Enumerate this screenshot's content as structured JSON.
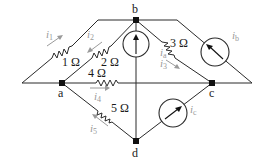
{
  "diagram": {
    "type": "circuit",
    "nodes": {
      "a": {
        "label": "a"
      },
      "b": {
        "label": "b"
      },
      "c": {
        "label": "c"
      },
      "d": {
        "label": "d"
      }
    },
    "resistors": {
      "r1": {
        "label": "1 Ω",
        "value_ohms": 1,
        "current": "i1"
      },
      "r2": {
        "label": "2 Ω",
        "value_ohms": 2,
        "current": "i2"
      },
      "r3": {
        "label": "3 Ω",
        "value_ohms": 3,
        "current": "i3"
      },
      "r4": {
        "label": "4 Ω",
        "value_ohms": 4,
        "current": "i4"
      },
      "r5": {
        "label": "5 Ω",
        "value_ohms": 5,
        "current": "i5"
      }
    },
    "sources": {
      "ia": {
        "symbol": "i",
        "sub": "a"
      },
      "ib": {
        "symbol": "i",
        "sub": "b"
      },
      "ic": {
        "symbol": "i",
        "sub": "c"
      }
    },
    "currents": {
      "i1": {
        "symbol": "i",
        "sub": "1"
      },
      "i2": {
        "symbol": "i",
        "sub": "2"
      },
      "i3": {
        "symbol": "i",
        "sub": "3"
      },
      "i4": {
        "symbol": "i",
        "sub": "4"
      },
      "i5": {
        "symbol": "i",
        "sub": "5"
      }
    }
  }
}
